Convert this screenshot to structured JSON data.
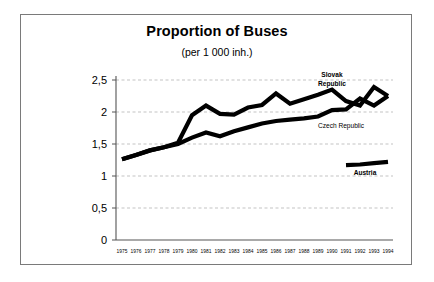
{
  "chart_data": {
    "type": "line",
    "title": "Proportion of Buses",
    "subtitle": "(per 1 000 inh.)",
    "xlabel": "",
    "ylabel": "",
    "xlim": [
      1975,
      1994
    ],
    "ylim": [
      0,
      2.5
    ],
    "grid": true,
    "grid_axis": "y",
    "legend_position": "inline-annotations",
    "ytick_labels": [
      "0",
      "0,5",
      "1",
      "1,5",
      "2",
      "2,5"
    ],
    "ytick_values": [
      0,
      0.5,
      1,
      1.5,
      2,
      2.5
    ],
    "x": [
      1975,
      1976,
      1977,
      1978,
      1979,
      1980,
      1981,
      1982,
      1983,
      1984,
      1985,
      1986,
      1987,
      1988,
      1989,
      1990,
      1991,
      1992,
      1993,
      1994
    ],
    "xtick_labels": [
      "1975",
      "1976",
      "1977",
      "1978",
      "1979",
      "1980",
      "1981",
      "1982",
      "1983",
      "1984",
      "1985",
      "1986",
      "1987",
      "1988",
      "1989",
      "1990",
      "1991",
      "1992",
      "1993",
      "1994"
    ],
    "series": [
      {
        "name": "Slovak Republic",
        "label": "Slovak Republic",
        "label_line1": "Slovak",
        "label_line2": "Republic",
        "color": "#000000",
        "x": [
          1975,
          1976,
          1977,
          1978,
          1979,
          1980,
          1981,
          1982,
          1983,
          1984,
          1985,
          1986,
          1987,
          1988,
          1989,
          1990,
          1991,
          1992,
          1993,
          1994
        ],
        "values": [
          1.26,
          1.33,
          1.4,
          1.45,
          1.52,
          1.95,
          2.1,
          1.97,
          1.96,
          2.07,
          2.11,
          2.29,
          2.13,
          2.2,
          2.27,
          2.35,
          2.17,
          2.1,
          2.39,
          2.25
        ]
      },
      {
        "name": "Czech Republic",
        "label": "Czech Republic",
        "color": "#000000",
        "x": [
          1975,
          1976,
          1977,
          1978,
          1979,
          1980,
          1981,
          1982,
          1983,
          1984,
          1985,
          1986,
          1987,
          1988,
          1989,
          1990,
          1991,
          1992,
          1993,
          1994
        ],
        "values": [
          1.26,
          1.33,
          1.4,
          1.45,
          1.5,
          1.6,
          1.68,
          1.62,
          1.7,
          1.76,
          1.82,
          1.86,
          1.88,
          1.9,
          1.93,
          2.03,
          2.04,
          2.21,
          2.1,
          2.25
        ]
      },
      {
        "name": "Austria",
        "label": "Austria",
        "color": "#000000",
        "x": [
          1991,
          1992,
          1993,
          1994
        ],
        "values": [
          1.17,
          1.18,
          1.2,
          1.22
        ]
      }
    ]
  }
}
